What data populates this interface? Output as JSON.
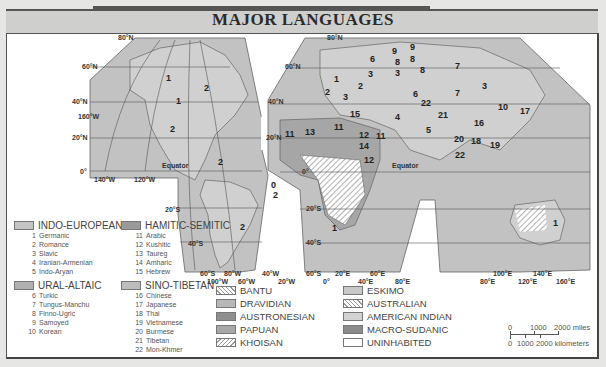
{
  "title": "MAJOR LANGUAGES",
  "colors": {
    "indo_european": "#c4c4c4",
    "hamitic_semitic": "#9a9a9a",
    "ural_altaic": "#b0b0b0",
    "sino_tibetan": "#bdbdbd",
    "dravidian": "#b8b8b8",
    "austronesian": "#8e8e8e",
    "papuan": "#a8a8a8",
    "eskimo": "#c8c8c8",
    "american_indian": "#d2d2d2",
    "macro_sudanic": "#8a8a8a",
    "uninhabited": "#ffffff",
    "ocean": "#c0c0c0",
    "land": "#cfcfcf"
  },
  "map": {
    "lat_labels_west": [
      "80°N",
      "60°N",
      "40°N",
      "20°N",
      "0°",
      "20°S",
      "40°S",
      "60°S"
    ],
    "lon_labels_west": [
      "160°W",
      "140°W",
      "120°W",
      "100°W",
      "80°W",
      "60°W",
      "40°W",
      "20°W"
    ],
    "lat_labels_east": [
      "80°N",
      "60°N",
      "40°N",
      "20°N",
      "0°",
      "20°S",
      "40°S",
      "60°S"
    ],
    "lon_labels_east": [
      "0°",
      "20°E",
      "40°E",
      "60°E",
      "80°E",
      "100°E",
      "120°E",
      "140°E",
      "160°E"
    ],
    "equator_label": "Equator",
    "region_numbers": [
      "1",
      "1",
      "2",
      "2",
      "2",
      "2",
      "0",
      "1",
      "2",
      "6",
      "9",
      "9",
      "8",
      "8",
      "8",
      "3",
      "3",
      "2",
      "2",
      "3",
      "1",
      "15",
      "4",
      "6",
      "22",
      "21",
      "5",
      "11",
      "13",
      "11",
      "12",
      "11",
      "14",
      "12",
      "7",
      "7",
      "3",
      "10",
      "17",
      "16",
      "20",
      "18",
      "19",
      "22",
      "1",
      "1"
    ]
  },
  "legend": {
    "families": [
      {
        "name": "INDO-EUROPEAN",
        "items": [
          {
            "n": "1",
            "label": "Germanic"
          },
          {
            "n": "2",
            "label": "Romance"
          },
          {
            "n": "3",
            "label": "Slavic"
          },
          {
            "n": "4",
            "label": "Iranian-Armenian"
          },
          {
            "n": "5",
            "label": "Indo-Aryan"
          }
        ]
      },
      {
        "name": "HAMITIC-SEMITIC",
        "items": [
          {
            "n": "11",
            "label": "Arabic"
          },
          {
            "n": "12",
            "label": "Kushitic"
          },
          {
            "n": "13",
            "label": "Taureg"
          },
          {
            "n": "14",
            "label": "Amharic"
          },
          {
            "n": "15",
            "label": "Hebrew"
          }
        ]
      },
      {
        "name": "URAL-ALTAIC",
        "items": [
          {
            "n": "6",
            "label": "Turkic"
          },
          {
            "n": "7",
            "label": "Tungus-Manchu"
          },
          {
            "n": "8",
            "label": "Finno-Ugric"
          },
          {
            "n": "9",
            "label": "Samoyed"
          },
          {
            "n": "10",
            "label": "Korean"
          }
        ]
      },
      {
        "name": "SINO-TIBETAN",
        "items": [
          {
            "n": "16",
            "label": "Chinese"
          },
          {
            "n": "17",
            "label": "Japanese"
          },
          {
            "n": "18",
            "label": "Thai"
          },
          {
            "n": "19",
            "label": "Vietnamese"
          },
          {
            "n": "20",
            "label": "Burmese"
          },
          {
            "n": "21",
            "label": "Tibetan"
          },
          {
            "n": "22",
            "label": "Mon-Khmer"
          }
        ]
      }
    ],
    "others_col1": [
      "BANTU",
      "DRAVIDIAN",
      "AUSTRONESIAN",
      "PAPUAN",
      "KHOISAN"
    ],
    "others_col2": [
      "ESKIMO",
      "AUSTRALIAN",
      "AMERICAN INDIAN",
      "MACRO-SUDANIC",
      "UNINHABITED"
    ]
  },
  "scale": {
    "miles_ticks": [
      "0",
      "1000",
      "2000 miles"
    ],
    "km_ticks": [
      "0",
      "1000",
      "2000 kilometers"
    ]
  }
}
